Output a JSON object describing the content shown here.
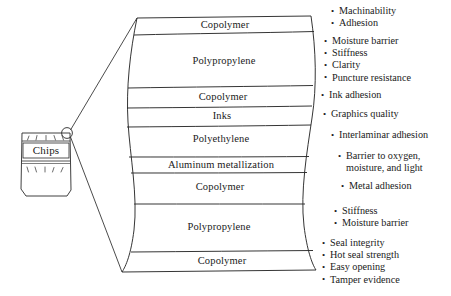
{
  "package": {
    "product_label": "Chips",
    "callout_name": "magnifier-callout"
  },
  "laminate": {
    "layers": [
      {
        "name": "Copolymer"
      },
      {
        "name": "Polypropylene"
      },
      {
        "name": "Copolymer"
      },
      {
        "name": "Inks"
      },
      {
        "name": "Polyethylene"
      },
      {
        "name": "Aluminum metallization"
      },
      {
        "name": "Copolymer"
      },
      {
        "name": "Polypropylene"
      },
      {
        "name": "Copolymer"
      }
    ]
  },
  "annotations": [
    {
      "items": [
        {
          "text": "Machinability"
        },
        {
          "text": "Adhesion"
        }
      ]
    },
    {
      "items": [
        {
          "text": "Moisture barrier"
        },
        {
          "text": "Stiffness"
        },
        {
          "text": "Clarity"
        },
        {
          "text": "Puncture resistance"
        }
      ]
    },
    {
      "items": [
        {
          "text": "Ink adhesion"
        }
      ]
    },
    {
      "items": [
        {
          "text": "Graphics quality"
        }
      ]
    },
    {
      "items": [
        {
          "text": "Interlaminar adhesion"
        }
      ]
    },
    {
      "items": [
        {
          "text": "Barrier to oxygen,",
          "continuation": "moisture, and light"
        }
      ]
    },
    {
      "items": [
        {
          "text": "Metal adhesion"
        }
      ]
    },
    {
      "items": [
        {
          "text": "Stiffness"
        },
        {
          "text": "Moisture barrier"
        }
      ]
    },
    {
      "items": [
        {
          "text": "Seal integrity"
        },
        {
          "text": "Hot seal strength"
        },
        {
          "text": "Easy opening"
        },
        {
          "text": "Tamper evidence"
        }
      ]
    }
  ],
  "colors": {
    "stroke": "#1a1a1a",
    "background": "#ffffff"
  }
}
